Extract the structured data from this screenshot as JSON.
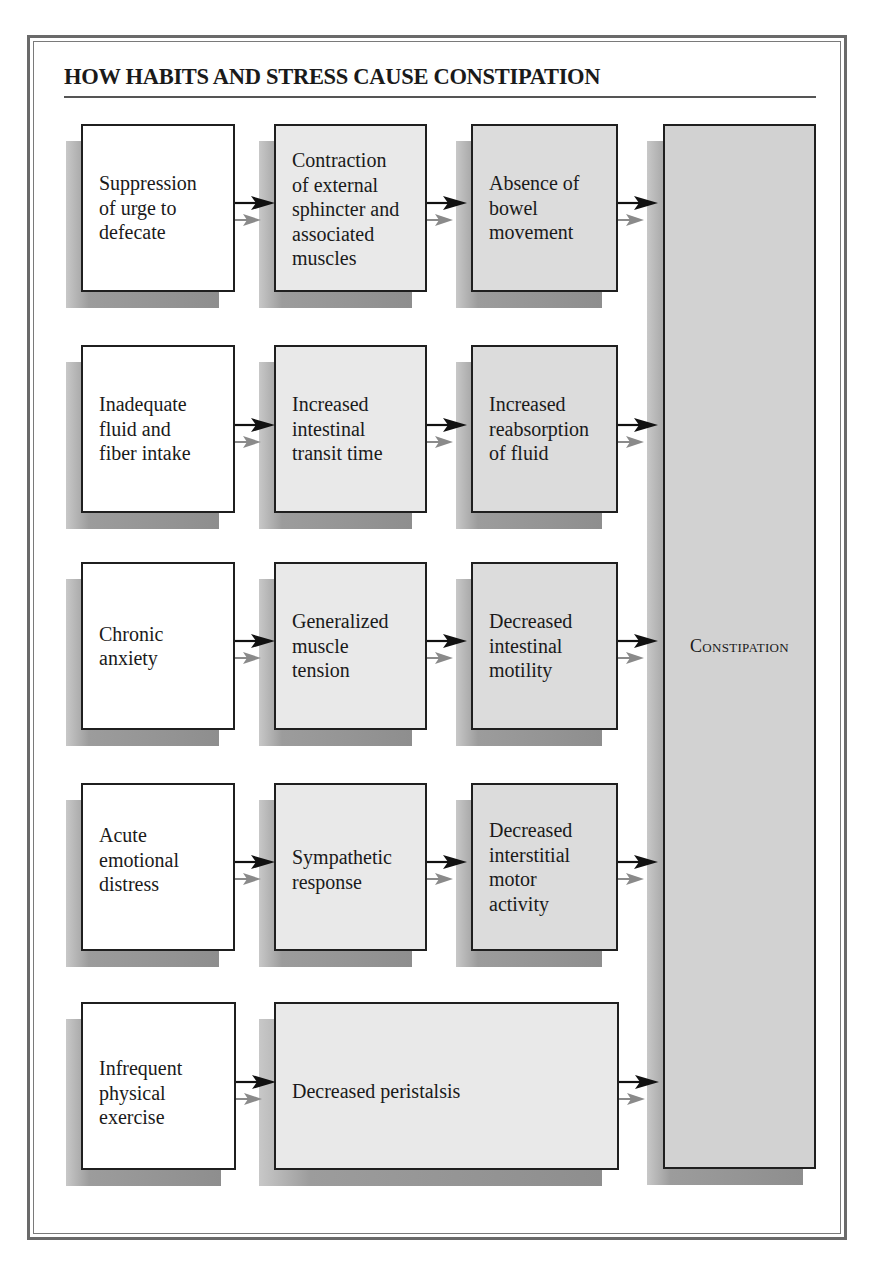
{
  "title": "HOW HABITS AND STRESS CAUSE CONSTIPATION",
  "outcome": "Constipation",
  "colors": {
    "frame": "#6a6a6a",
    "box_border": "#1f1f1f",
    "box_white": "#ffffff",
    "box_grey_light": "#e9e9e9",
    "box_grey_mid": "#dcdcdc",
    "box_grey_dark": "#d2d2d2",
    "shadow": "#9a9a9a",
    "arrow_primary": "#111111",
    "arrow_secondary": "#8a8a8a"
  },
  "rows": [
    {
      "cause": "Suppression\nof urge to\ndefecate",
      "step2": "Contraction\nof external\nsphincter and\nassociated\nmuscles",
      "step3": "Absence of\nbowel\nmovement"
    },
    {
      "cause": "Inadequate\nfluid and\nfiber intake",
      "step2": "Increased\nintestinal\ntransit time",
      "step3": "Increased\nreabsorption\nof fluid"
    },
    {
      "cause": "Chronic\nanxiety",
      "step2": "Generalized\nmuscle\ntension",
      "step3": "Decreased\nintestinal\nmotility"
    },
    {
      "cause": "Acute\nemotional\ndistress",
      "step2": "Sympathetic\nresponse",
      "step3": "Decreased\ninterstitial\nmotor\nactivity"
    },
    {
      "cause": "Infrequent\nphysical\nexercise",
      "step2": "Decreased peristalsis"
    }
  ]
}
